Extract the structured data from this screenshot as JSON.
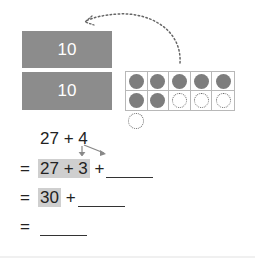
{
  "tens_blocks": [
    {
      "label": "10"
    },
    {
      "label": "10"
    }
  ],
  "ten_frame": {
    "rows": 2,
    "columns": 5,
    "cells": [
      "filled",
      "filled",
      "filled",
      "filled",
      "filled",
      "filled",
      "filled",
      "empty",
      "empty",
      "empty"
    ],
    "extra_counter": "empty"
  },
  "arrow": {
    "style": "dotted-curve",
    "from": "ten-frame",
    "to": "tens-blocks"
  },
  "problem": {
    "line1": {
      "a": "27",
      "op": "+",
      "b": "4"
    },
    "line2": {
      "eq": "=",
      "highlight": "27 + 3",
      "op": "+",
      "blank": "______"
    },
    "line3": {
      "eq": "=",
      "highlight": "30",
      "op": "+",
      "blank": "______"
    },
    "line4": {
      "eq": "=",
      "blank": "______"
    }
  },
  "colors": {
    "tens_block": "#8c8c8c",
    "counter_filled": "#7d7d7d",
    "highlight": "#cfcfcf",
    "text": "#222222"
  }
}
